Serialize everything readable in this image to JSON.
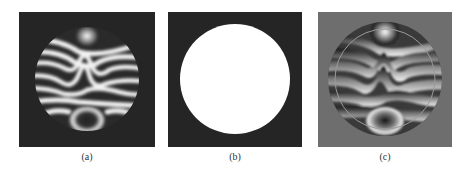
{
  "figure": {
    "panels": [
      {
        "id": "a",
        "label": "(a)",
        "description": "Interference fringe pattern within circular aperture on dark background",
        "background": "#252525"
      },
      {
        "id": "b",
        "label": "(b)",
        "description": "White circular binary mask on dark background",
        "background": "#252525"
      },
      {
        "id": "c",
        "label": "(c)",
        "description": "Extrapolated wrapped phase fringes beyond aperture on gray background with circle outline",
        "background": "#6e6e6e"
      }
    ]
  }
}
